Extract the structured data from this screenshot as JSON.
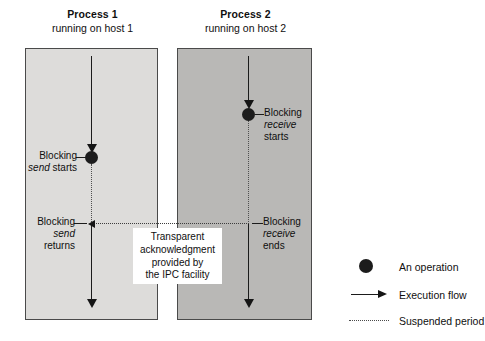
{
  "processes": [
    {
      "id": "process-1",
      "title": "Process 1",
      "subtitle": "running on host 1",
      "box_shade": "#dddcda",
      "events": [
        {
          "id": "blocking-send-starts",
          "line1": "Blocking",
          "line2_italic": "send",
          "line2_rest": " starts",
          "side": "left"
        },
        {
          "id": "blocking-send-returns",
          "line1": "Blocking",
          "line2_italic": "send",
          "line3": "returns",
          "side": "left"
        }
      ]
    },
    {
      "id": "process-2",
      "title": "Process 2",
      "subtitle": "running on host 2",
      "box_shade": "#b9b8b6",
      "events": [
        {
          "id": "blocking-receive-starts",
          "line1": "Blocking",
          "line2_italic": "receive",
          "line3": "starts",
          "side": "right"
        },
        {
          "id": "blocking-receive-ends",
          "line1": "Blocking",
          "line2_italic": "receive",
          "line3": "ends",
          "side": "right"
        }
      ]
    }
  ],
  "callout": {
    "id": "transparent-acknowledgment-note",
    "line1": "Transparent",
    "line2": "acknowledgment",
    "line3": "provided by",
    "line4": "the IPC facility"
  },
  "legend": {
    "items": [
      {
        "id": "an-operation",
        "symbol": "filled-circle",
        "label": "An operation"
      },
      {
        "id": "execution-flow",
        "symbol": "solid-arrow",
        "label": "Execution flow"
      },
      {
        "id": "suspended-period",
        "symbol": "dotted-line",
        "label": "Suspended period"
      }
    ]
  },
  "colors": {
    "ink": "#151515",
    "box_border": "#4a4a4a",
    "box_light": "#dddcda",
    "box_dark": "#b9b8b6",
    "dotted": "#4f4f4f",
    "page_bg": "#ffffff"
  }
}
